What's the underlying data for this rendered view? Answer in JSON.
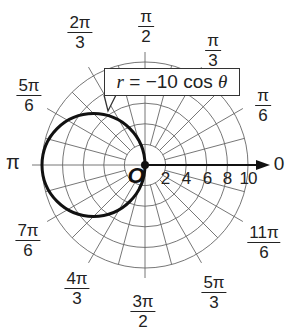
{
  "figure": {
    "equation_label": "r = −10 cos θ",
    "equation_parts": {
      "lhs": "r",
      "eq": " = −10 cos ",
      "theta": "θ"
    },
    "origin_label": "O",
    "polar_axis_label": "0",
    "radial_ticks": [
      "2",
      "4",
      "6",
      "8",
      "10"
    ],
    "angle_labels": [
      {
        "id": "pi_over_2",
        "num": "π",
        "den": "2"
      },
      {
        "id": "2pi_over_3",
        "num": "2π",
        "den": "3"
      },
      {
        "id": "pi_over_3",
        "num": "π",
        "den": "3"
      },
      {
        "id": "5pi_over_6",
        "num": "5π",
        "den": "6"
      },
      {
        "id": "pi_over_6",
        "num": "π",
        "den": "6"
      },
      {
        "id": "pi",
        "single": "π"
      },
      {
        "id": "7pi_over_6",
        "num": "7π",
        "den": "6"
      },
      {
        "id": "11pi_over_6",
        "num": "11π",
        "den": "6"
      },
      {
        "id": "4pi_over_3",
        "num": "4π",
        "den": "3"
      },
      {
        "id": "3pi_over_2",
        "num": "3π",
        "den": "2"
      },
      {
        "id": "5pi_over_3",
        "num": "5π",
        "den": "3"
      }
    ],
    "grid": {
      "max_r": 10,
      "ring_step": 2,
      "spoke_step_deg": 15
    },
    "curve": {
      "type": "circle",
      "center_polar": [
        5,
        "π"
      ],
      "radius": 5
    },
    "colors": {
      "grid": "#555555",
      "curve": "#111111",
      "text": "#222222"
    }
  }
}
